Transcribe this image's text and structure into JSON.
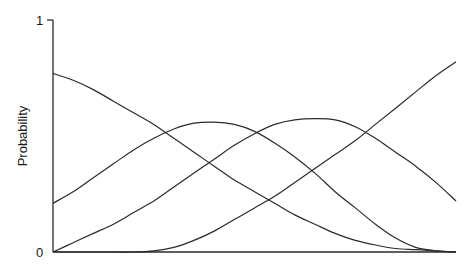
{
  "chart_data": {
    "type": "line",
    "title": "",
    "xlabel": "",
    "ylabel": "Probability",
    "ylim": [
      0,
      1
    ],
    "xlim": [
      0,
      1
    ],
    "y_ticks": [
      {
        "value": 0,
        "label": "0"
      },
      {
        "value": 1,
        "label": "1"
      }
    ],
    "x_ticks": [],
    "grid": false,
    "legend": null,
    "x": [
      0,
      0.05,
      0.1,
      0.15,
      0.2,
      0.25,
      0.3,
      0.35,
      0.4,
      0.45,
      0.5,
      0.55,
      0.6,
      0.65,
      0.7,
      0.75,
      0.8,
      0.85,
      0.9,
      0.95,
      1.0
    ],
    "series": [
      {
        "name": "curve-1",
        "values": [
          0.77,
          0.74,
          0.7,
          0.65,
          0.6,
          0.55,
          0.49,
          0.43,
          0.37,
          0.31,
          0.26,
          0.21,
          0.16,
          0.12,
          0.08,
          0.05,
          0.03,
          0.015,
          0.01,
          0.005,
          0.0
        ]
      },
      {
        "name": "curve-2",
        "values": [
          0.21,
          0.26,
          0.32,
          0.38,
          0.44,
          0.49,
          0.53,
          0.555,
          0.56,
          0.55,
          0.52,
          0.47,
          0.41,
          0.34,
          0.26,
          0.19,
          0.12,
          0.06,
          0.02,
          0.005,
          0.0
        ]
      },
      {
        "name": "curve-3",
        "values": [
          0.0,
          0.04,
          0.08,
          0.12,
          0.17,
          0.22,
          0.28,
          0.34,
          0.4,
          0.46,
          0.51,
          0.55,
          0.57,
          0.575,
          0.57,
          0.54,
          0.49,
          0.43,
          0.37,
          0.3,
          0.22
        ]
      },
      {
        "name": "curve-4",
        "values": [
          0.0,
          0.0,
          0.0,
          0.0,
          0.0,
          0.005,
          0.02,
          0.05,
          0.09,
          0.14,
          0.19,
          0.24,
          0.3,
          0.36,
          0.42,
          0.48,
          0.55,
          0.62,
          0.69,
          0.76,
          0.82
        ]
      }
    ]
  },
  "labels": {
    "y_axis_title": "Probability",
    "y_top": "1",
    "y_bottom": "0"
  }
}
